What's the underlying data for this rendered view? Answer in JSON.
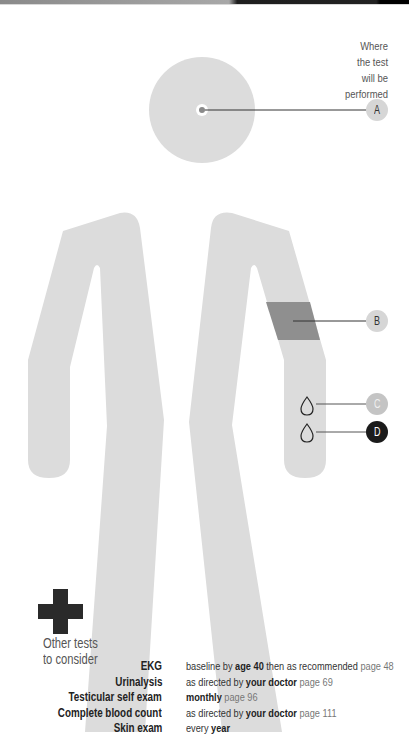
{
  "legend": {
    "where_label": [
      "Where",
      "the test",
      "will be",
      "performed"
    ]
  },
  "markers": [
    {
      "id": "A",
      "label": "A",
      "location": "head/eye",
      "color": "#d6d6d6"
    },
    {
      "id": "B",
      "label": "B",
      "location": "upper arm",
      "color": "#d6d6d6"
    },
    {
      "id": "C",
      "label": "C",
      "location": "forearm (blood drop)",
      "color": "#c4c4c4"
    },
    {
      "id": "D",
      "label": "D",
      "location": "forearm (blood drop)",
      "color": "#1b1b1b"
    }
  ],
  "other_tests": {
    "heading_line1": "Other tests",
    "heading_line2": "to consider",
    "rows": [
      {
        "name": "EKG",
        "parts": [
          {
            "t": "baseline by ",
            "s": "n"
          },
          {
            "t": "age 40",
            "s": "b"
          },
          {
            "t": " then as recommended ",
            "s": "n"
          },
          {
            "t": "page 48",
            "s": "p"
          }
        ]
      },
      {
        "name": "Urinalysis",
        "parts": [
          {
            "t": "as directed by ",
            "s": "n"
          },
          {
            "t": "your doctor",
            "s": "b"
          },
          {
            "t": " page 69",
            "s": "p"
          }
        ]
      },
      {
        "name": "Testicular self exam",
        "parts": [
          {
            "t": "monthly",
            "s": "b"
          },
          {
            "t": " page 96",
            "s": "p"
          }
        ]
      },
      {
        "name": "Complete blood count",
        "parts": [
          {
            "t": "as directed by ",
            "s": "n"
          },
          {
            "t": "your doctor",
            "s": "b"
          },
          {
            "t": " page 111",
            "s": "p"
          }
        ]
      },
      {
        "name": "Skin exam",
        "parts": [
          {
            "t": "every ",
            "s": "n"
          },
          {
            "t": "year",
            "s": "b"
          }
        ]
      }
    ]
  },
  "colors": {
    "figure": "#dcdcdc",
    "highlight_band": "#8f8f8f",
    "cross": "#2a2a2a",
    "line": "#333333"
  }
}
